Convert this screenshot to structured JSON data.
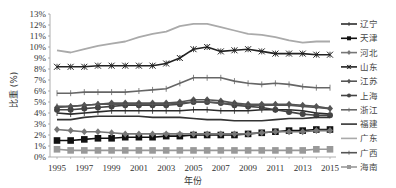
{
  "chart_data": {
    "type": "line",
    "title": "",
    "xlabel": "年份",
    "ylabel": "比重 (%)",
    "ylim": [
      0,
      13
    ],
    "y_ticks": [
      "0%",
      "1%",
      "2%",
      "3%",
      "4%",
      "5%",
      "6%",
      "7%",
      "8%",
      "9%",
      "10%",
      "11%",
      "12%",
      "13%"
    ],
    "x_tick_labels": [
      "1995",
      "1997",
      "1999",
      "2001",
      "2003",
      "2005",
      "2007",
      "2009",
      "2011",
      "2013",
      "2015"
    ],
    "grid": false,
    "legend_position": "right",
    "x": [
      1995,
      1996,
      1997,
      1998,
      1999,
      2000,
      2001,
      2002,
      2003,
      2004,
      2005,
      2006,
      2007,
      2008,
      2009,
      2010,
      2011,
      2012,
      2013,
      2014,
      2015
    ],
    "series": [
      {
        "name": "辽宁",
        "color": "#2b2b2b",
        "marker": "plus",
        "values": [
          4.0,
          3.9,
          4.0,
          4.1,
          4.2,
          4.2,
          4.2,
          4.2,
          4.2,
          4.2,
          4.3,
          4.3,
          4.2,
          4.2,
          4.2,
          4.3,
          4.3,
          4.3,
          4.2,
          4.0,
          3.9
        ]
      },
      {
        "name": "天津",
        "color": "#111111",
        "marker": "square",
        "values": [
          1.5,
          1.5,
          1.6,
          1.7,
          1.7,
          1.8,
          1.8,
          1.8,
          1.9,
          1.9,
          2.0,
          2.0,
          2.0,
          2.0,
          2.1,
          2.2,
          2.3,
          2.4,
          2.4,
          2.5,
          2.5
        ]
      },
      {
        "name": "河北",
        "color": "#777777",
        "marker": "diamond",
        "values": [
          2.5,
          2.4,
          2.3,
          2.3,
          2.2,
          2.1,
          2.1,
          2.1,
          2.1,
          2.1,
          2.1,
          2.1,
          2.1,
          2.1,
          2.1,
          2.2,
          2.3,
          2.3,
          2.3,
          2.4,
          2.4
        ]
      },
      {
        "name": "山东",
        "color": "#222222",
        "marker": "x",
        "values": [
          8.2,
          8.2,
          8.2,
          8.3,
          8.3,
          8.3,
          8.3,
          8.3,
          8.5,
          9.0,
          9.8,
          10.0,
          9.6,
          9.7,
          9.8,
          9.6,
          9.4,
          9.4,
          9.4,
          9.3,
          9.3
        ]
      },
      {
        "name": "江苏",
        "color": "#555555",
        "marker": "diamond",
        "values": [
          4.5,
          4.6,
          4.7,
          4.8,
          4.9,
          4.9,
          4.9,
          4.9,
          4.9,
          5.0,
          5.2,
          5.2,
          5.1,
          4.9,
          4.8,
          4.8,
          4.8,
          4.8,
          4.7,
          4.6,
          4.4
        ]
      },
      {
        "name": "上海",
        "color": "#444444",
        "marker": "circle",
        "values": [
          4.3,
          4.3,
          4.4,
          4.5,
          4.6,
          4.7,
          4.7,
          4.7,
          4.7,
          4.8,
          5.0,
          5.0,
          4.9,
          4.7,
          4.6,
          4.5,
          4.3,
          4.1,
          3.9,
          3.8,
          3.8
        ]
      },
      {
        "name": "浙江",
        "color": "#666666",
        "marker": "plus",
        "values": [
          5.8,
          5.8,
          5.9,
          5.9,
          5.9,
          5.9,
          6.0,
          6.1,
          6.2,
          6.7,
          7.2,
          7.2,
          7.2,
          6.9,
          6.7,
          6.6,
          6.7,
          6.6,
          6.4,
          6.3,
          6.3
        ]
      },
      {
        "name": "福建",
        "color": "#333333",
        "marker": "none",
        "values": [
          3.4,
          3.4,
          3.6,
          3.7,
          3.7,
          3.7,
          3.7,
          3.6,
          3.6,
          3.6,
          3.5,
          3.4,
          3.4,
          3.3,
          3.3,
          3.3,
          3.4,
          3.5,
          3.5,
          3.6,
          3.6
        ]
      },
      {
        "name": "广东",
        "color": "#aaaaaa",
        "marker": "none",
        "values": [
          9.7,
          9.5,
          9.8,
          10.1,
          10.3,
          10.5,
          10.9,
          11.2,
          11.4,
          11.9,
          12.1,
          12.1,
          11.8,
          11.5,
          11.2,
          11.1,
          10.9,
          10.6,
          10.4,
          10.5,
          10.5
        ]
      },
      {
        "name": "广西",
        "color": "#555555",
        "marker": "plus",
        "values": [
          4.6,
          4.6,
          4.7,
          4.8,
          4.8,
          4.8,
          4.8,
          4.8,
          4.8,
          4.9,
          5.0,
          5.0,
          4.9,
          4.8,
          4.7,
          4.7,
          4.7,
          4.7,
          4.6,
          4.5,
          4.4
        ]
      },
      {
        "name": "海南",
        "color": "#999999",
        "marker": "square",
        "values": [
          0.7,
          0.6,
          0.6,
          0.6,
          0.6,
          0.6,
          0.6,
          0.6,
          0.6,
          0.6,
          0.6,
          0.6,
          0.6,
          0.6,
          0.6,
          0.6,
          0.6,
          0.6,
          0.6,
          0.7,
          0.7
        ]
      }
    ]
  },
  "legend": {
    "items": [
      "辽宁",
      "天津",
      "河北",
      "山东",
      "江苏",
      "上海",
      "浙江",
      "福建",
      "广东",
      "广西",
      "海南"
    ]
  }
}
